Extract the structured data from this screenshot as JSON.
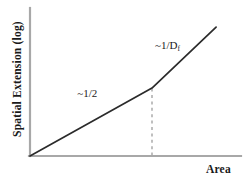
{
  "chart_data": {
    "type": "line",
    "title": "",
    "subtitle": "",
    "xlabel": "Area",
    "ylabel": "Spatial Extension (log)",
    "grid": false,
    "legend": null,
    "axis_style": "log-log schematic, no tick labels",
    "xlim": [
      0,
      1
    ],
    "ylim": [
      0,
      1
    ],
    "series": [
      {
        "name": "spatial extension vs area",
        "comment": "piecewise two-segment curve with a crossover kink",
        "x": [
          0.0,
          0.581,
          0.886
        ],
        "y": [
          0.0,
          0.459,
          0.871
        ]
      }
    ],
    "segments": [
      {
        "name": "low-area regime",
        "slope_label": "~1/2",
        "slope_value": 0.5,
        "from": [
          0.0,
          0.0
        ],
        "to": [
          0.581,
          0.459
        ]
      },
      {
        "name": "high-area regime",
        "slope_label": "~1/Df",
        "slope_value": null,
        "from": [
          0.581,
          0.459
        ],
        "to": [
          0.886,
          0.871
        ]
      }
    ],
    "annotations": [
      {
        "name": "slope-low",
        "text_prefix": "~1/2",
        "text_sub": "",
        "x": 0.23,
        "y": 0.4
      },
      {
        "name": "slope-high",
        "text_prefix": "~1/D",
        "text_sub": "f",
        "x": 0.6,
        "y": 0.72
      }
    ],
    "crossover": {
      "name": "crossover-point",
      "x": 0.581,
      "y": 0.459,
      "marker_line": "dashed vertical drop to x-axis"
    }
  },
  "axes": {
    "y_label": "Spatial Extension (log)",
    "x_label": "Area"
  },
  "annotations": {
    "low_slope_prefix": "~1/2",
    "high_slope_prefix": "~1/D",
    "high_slope_subscript": "f"
  },
  "colors": {
    "curve": "#2b2b2b",
    "axis": "#a8a8a8",
    "dashed_guide": "#b0b0b0",
    "text": "#1a1a1a",
    "background": "#ffffff"
  }
}
